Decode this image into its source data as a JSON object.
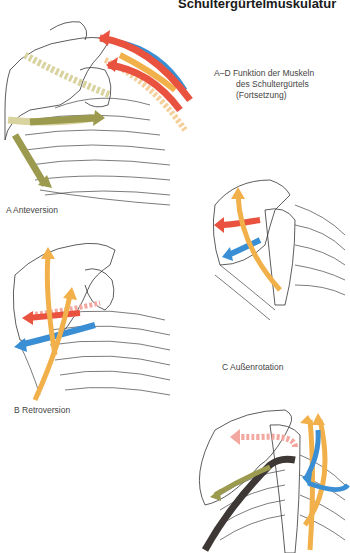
{
  "page": {
    "title": "Schultergürtelmuskulatur",
    "caption": {
      "line1": "A–D Funktion der Muskeln",
      "line2": "des Schultergürtels",
      "line3": "(Fortsetzung)"
    }
  },
  "figures": [
    {
      "id": "A",
      "label": "A  Anteversion",
      "arrows": [
        "red",
        "blue",
        "orange",
        "olive",
        "light-orange-dashed",
        "olive-dashed"
      ]
    },
    {
      "id": "B",
      "label": "B  Retroversion",
      "arrows": [
        "red",
        "blue",
        "orange",
        "orange",
        "pink-dashed",
        "lightblue-dashed"
      ]
    },
    {
      "id": "C",
      "label": "C  Außenrotation",
      "arrows": [
        "red",
        "blue",
        "orange"
      ]
    },
    {
      "id": "D",
      "label": "",
      "arrows": [
        "pink-dashed",
        "dark-gray",
        "olive",
        "orange",
        "orange",
        "blue",
        "blue"
      ]
    }
  ],
  "colors": {
    "red": "#e8523f",
    "blue": "#3a8fd4",
    "orange": "#f2b04a",
    "olive": "#9c9a4e",
    "pink": "#f2a8a0",
    "dark": "#3d3836",
    "lightorange": "#f5cf9a",
    "lightolive": "#d9d3a0"
  }
}
